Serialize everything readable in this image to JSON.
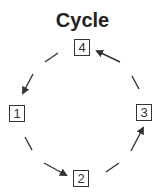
{
  "title": "Cycle",
  "nodes": [
    {
      "id": "1",
      "label": "1"
    },
    {
      "id": "2",
      "label": "2"
    },
    {
      "id": "3",
      "label": "3"
    },
    {
      "id": "4",
      "label": "4"
    }
  ],
  "edges": [
    {
      "from": "4",
      "to": "1",
      "style": "dashed-arrow"
    },
    {
      "from": "1",
      "to": "2",
      "style": "dashed-arrow"
    },
    {
      "from": "2",
      "to": "3",
      "style": "dashed-arrow"
    },
    {
      "from": "3",
      "to": "4",
      "style": "dashed-arrow"
    }
  ],
  "colors": {
    "stroke": "#333333",
    "text": "#222222"
  }
}
